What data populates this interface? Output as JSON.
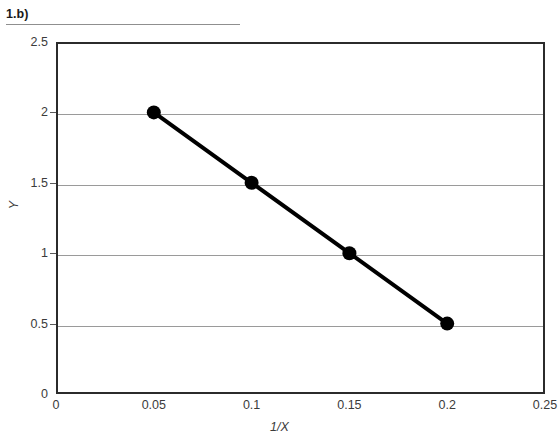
{
  "figure": {
    "label": "1.b)",
    "rule_visible": true
  },
  "chart_data": {
    "type": "line",
    "title": "",
    "subtitle": "",
    "xlabel": "1/X",
    "ylabel": "Y",
    "xlim": [
      0,
      0.25
    ],
    "ylim": [
      0,
      2.5
    ],
    "grid": "horizontal",
    "legend": "none",
    "x": [
      0.05,
      0.1,
      0.15,
      0.2
    ],
    "series": [
      {
        "name": "Y vs 1/X",
        "values": [
          2,
          1.5,
          1,
          0.5
        ],
        "color": "#000000",
        "marker": "circle",
        "line_width": 4
      }
    ],
    "points": [
      {
        "x": 0.05,
        "y": 2
      },
      {
        "x": 0.1,
        "y": 1.5
      },
      {
        "x": 0.15,
        "y": 1
      },
      {
        "x": 0.2,
        "y": 0.5
      }
    ],
    "xticks": [
      "0",
      "0.05",
      "0.1",
      "0.15",
      "0.2",
      "0.25"
    ],
    "xtick_values": [
      0,
      0.05,
      0.1,
      0.15,
      0.2,
      0.25
    ],
    "yticks": [
      "0",
      "0.5",
      "1",
      "1.5",
      "2",
      "2.5"
    ],
    "ytick_values": [
      0,
      0.5,
      1,
      1.5,
      2,
      2.5
    ],
    "gridline_values": [
      0.5,
      1,
      1.5,
      2
    ],
    "colors": {
      "series": "#000000",
      "gridline": "#9a9a9a",
      "frame": "#2b2b2b",
      "text": "#3b3b3b",
      "rule": "#8f8f8f",
      "background": "#ffffff"
    }
  }
}
